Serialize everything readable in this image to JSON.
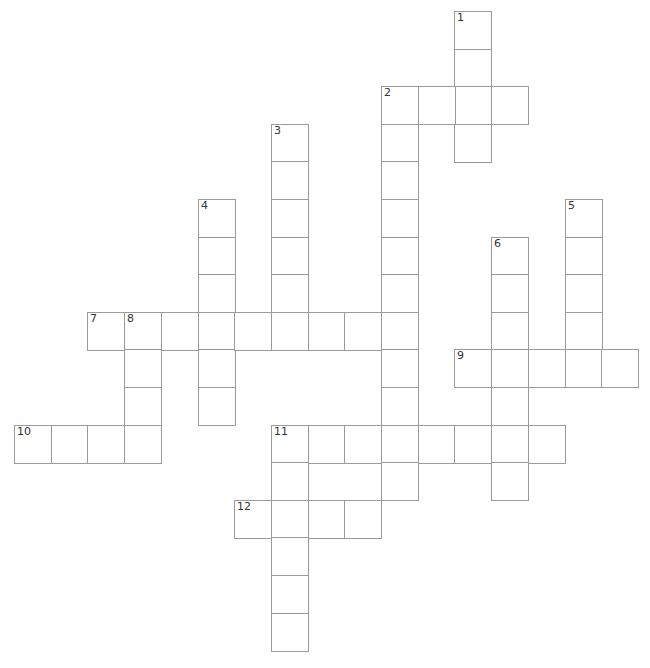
{
  "puzzle": {
    "type": "crossword",
    "grid": {
      "origin_x": 14,
      "origin_y": 11,
      "col_step": 36.7,
      "row_step": 37.6,
      "cols": 17,
      "rows": 17,
      "border_color": "#9a9a9a",
      "cell_fill": "#ffffff",
      "number_color": "#333333"
    },
    "entries": [
      {
        "number": "1",
        "direction": "down",
        "col": 12,
        "row": 0,
        "length": 4
      },
      {
        "number": "2",
        "direction": "across",
        "col": 10,
        "row": 2,
        "length": 4
      },
      {
        "number": "2",
        "direction": "down",
        "col": 10,
        "row": 2,
        "length": 11
      },
      {
        "number": "3",
        "direction": "down",
        "col": 7,
        "row": 3,
        "length": 6
      },
      {
        "number": "4",
        "direction": "down",
        "col": 5,
        "row": 5,
        "length": 6
      },
      {
        "number": "5",
        "direction": "down",
        "col": 15,
        "row": 5,
        "length": 5
      },
      {
        "number": "6",
        "direction": "down",
        "col": 13,
        "row": 6,
        "length": 7
      },
      {
        "number": "7",
        "direction": "across",
        "col": 2,
        "row": 8,
        "length": 9
      },
      {
        "number": "8",
        "direction": "down",
        "col": 3,
        "row": 8,
        "length": 4
      },
      {
        "number": "9",
        "direction": "across",
        "col": 12,
        "row": 9,
        "length": 5
      },
      {
        "number": "10",
        "direction": "across",
        "col": 0,
        "row": 11,
        "length": 4
      },
      {
        "number": "11",
        "direction": "across",
        "col": 7,
        "row": 11,
        "length": 8
      },
      {
        "number": "11",
        "direction": "down",
        "col": 7,
        "row": 11,
        "length": 6
      },
      {
        "number": "12",
        "direction": "across",
        "col": 6,
        "row": 13,
        "length": 4
      }
    ],
    "cell_values": {}
  }
}
